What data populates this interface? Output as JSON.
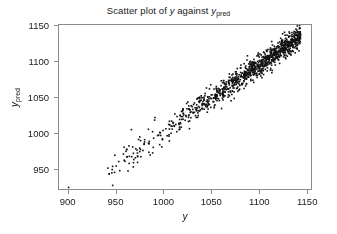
{
  "chart_data": {
    "type": "scatter",
    "title_parts": {
      "prefix": "Scatter plot of ",
      "var1": "y",
      "middle": " against ",
      "var2": "y",
      "var2_sub": "pred"
    },
    "xlabel": "y",
    "ylabel": "y",
    "ylabel_sub": "pred",
    "xlabel_sub": "",
    "xlim": [
      890,
      1155
    ],
    "ylim": [
      920,
      1152
    ],
    "xticks": [
      900,
      950,
      1000,
      1050,
      1100,
      1150
    ],
    "yticks": [
      950,
      1000,
      1050,
      1100,
      1150
    ],
    "xtick_labels": [
      "900",
      "950",
      "1000",
      "1050",
      "1100",
      "1150"
    ],
    "ytick_labels": [
      "950",
      "1000",
      "1050",
      "1100",
      "1150"
    ],
    "grid": false,
    "legend": null,
    "marker": "square",
    "marker_size_px": 1.6,
    "marker_color": "#111111",
    "frame_color": "#8c8c8c",
    "n_points": 1050,
    "correlation": 0.97,
    "band_half_width": 11,
    "point_generation": {
      "main_cluster": {
        "n": 980,
        "x_min": 985,
        "x_max": 1142,
        "density_power": 2.1,
        "slope": 0.92,
        "intercept": 85,
        "noise_sd": 7.5
      },
      "sparse_tail": {
        "n": 62,
        "x_min": 940,
        "x_max": 1000,
        "slope": 0.92,
        "intercept": 85,
        "noise_sd": 11
      },
      "outliers": [
        {
          "x": 900,
          "y": 925
        },
        {
          "x": 941,
          "y": 952
        },
        {
          "x": 948,
          "y": 946
        },
        {
          "x": 962,
          "y": 948
        },
        {
          "x": 958,
          "y": 963
        },
        {
          "x": 968,
          "y": 964
        },
        {
          "x": 972,
          "y": 960
        },
        {
          "x": 975,
          "y": 978
        },
        {
          "x": 963,
          "y": 983
        },
        {
          "x": 984,
          "y": 986
        }
      ]
    }
  }
}
